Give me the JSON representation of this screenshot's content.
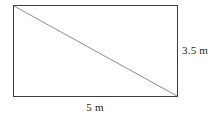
{
  "figure": {
    "type": "geometry-diagram",
    "shape": "rectangle-with-diagonal",
    "background_color": "#ffffff",
    "stroke_color": "#3b3b3b",
    "diagonal_color": "#8c8c8c",
    "rectangle": {
      "x": 13,
      "y": 5,
      "width": 165,
      "height": 92
    },
    "diagonal": {
      "x1": 13,
      "y1": 5,
      "x2": 178,
      "y2": 97
    },
    "labels": {
      "height": "3.5 m",
      "width": "5 m"
    },
    "measurements": {
      "height_value": 3.5,
      "width_value": 5,
      "unit": "m"
    }
  }
}
